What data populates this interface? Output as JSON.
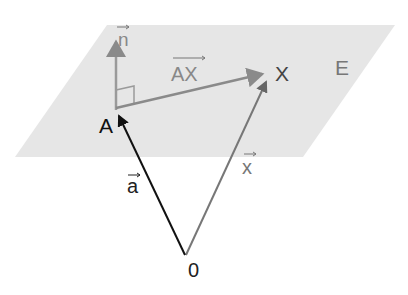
{
  "diagram": {
    "plane_label": "E",
    "points": {
      "A": "A",
      "X": "X",
      "origin": "0"
    },
    "vectors": {
      "normal": "n",
      "AX": "AX",
      "a": "a",
      "x": "x"
    },
    "colors": {
      "plane": "#e6e6e6",
      "gray_vector": "#8a8a8a",
      "black_vector": "#111111",
      "label": "#555555"
    }
  }
}
